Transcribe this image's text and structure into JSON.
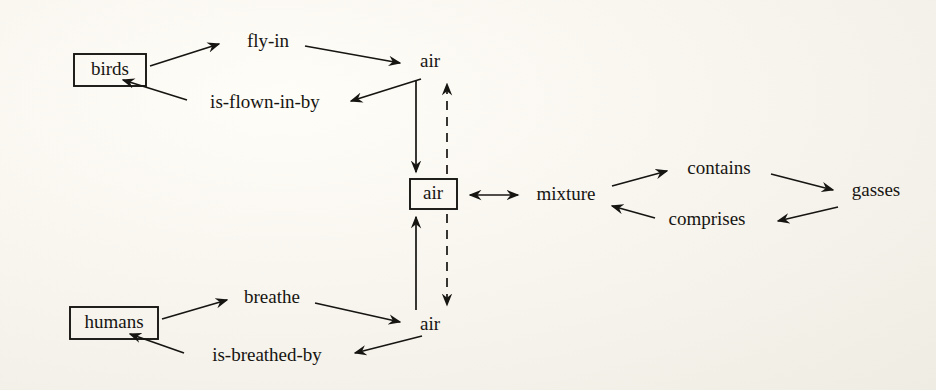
{
  "figure": {
    "kind": "semantic-network-diagram",
    "background_color": "#f7f5ef",
    "ink_color": "#171512"
  },
  "nodes": {
    "birds": {
      "label": "birds",
      "boxed": true,
      "x": 108,
      "y": 70
    },
    "air_top": {
      "label": "air",
      "boxed": false,
      "x": 430,
      "y": 63
    },
    "air_center": {
      "label": "air",
      "boxed": true,
      "x": 433,
      "y": 194
    },
    "air_bottom": {
      "label": "air",
      "boxed": false,
      "x": 430,
      "y": 326
    },
    "humans": {
      "label": "humans",
      "boxed": true,
      "x": 112,
      "y": 323
    },
    "mixture": {
      "label": "mixture",
      "boxed": false,
      "x": 566,
      "y": 196
    },
    "gasses": {
      "label": "gasses",
      "boxed": false,
      "x": 876,
      "y": 192
    }
  },
  "relations": {
    "fly_in": {
      "label": "fly-in",
      "from": "birds",
      "to": "air_top",
      "x": 268,
      "y": 43
    },
    "is_flown_in_by": {
      "label": "is-flown-in-by",
      "from": "air_top",
      "to": "birds",
      "x": 265,
      "y": 104
    },
    "breathe": {
      "label": "breathe",
      "from": "humans",
      "to": "air_bottom",
      "x": 272,
      "y": 299
    },
    "is_breathed_by": {
      "label": "is-breathed-by",
      "from": "air_bottom",
      "to": "humans",
      "x": 267,
      "y": 357
    },
    "contains": {
      "label": "contains",
      "from": "mixture",
      "to": "gasses",
      "x": 719,
      "y": 170
    },
    "comprises": {
      "label": "comprises",
      "from": "gasses",
      "to": "mixture",
      "x": 707,
      "y": 221
    }
  },
  "links": {
    "top_down_solid": {
      "style": "solid",
      "direction": "down",
      "from": "air_top",
      "to": "air_center"
    },
    "center_up_dashed": {
      "style": "dashed",
      "direction": "up",
      "from": "air_center",
      "to": "air_top"
    },
    "bottom_up_solid": {
      "style": "solid",
      "direction": "up",
      "from": "air_bottom",
      "to": "air_center"
    },
    "center_down_dashed": {
      "style": "dashed",
      "direction": "down",
      "from": "air_center",
      "to": "air_bottom"
    },
    "air_mixture": {
      "style": "solid",
      "direction": "both",
      "from": "air_center",
      "to": "mixture"
    }
  }
}
